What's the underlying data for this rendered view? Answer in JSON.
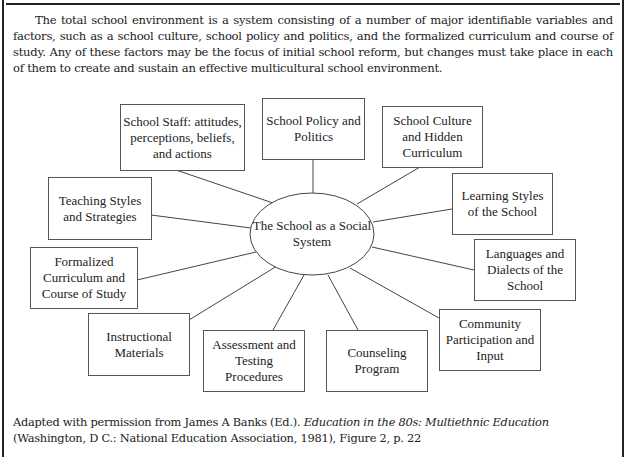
{
  "intro": {
    "text": "The total school environment is a system consisting of a number of major identifiable variables and factors, such as a school culture, school policy and politics, and the formalized curriculum and course of study. Any of these factors may be the focus of initial school reform, but changes must take place in each of them to create and sustain an effective multicultural school environment."
  },
  "diagram": {
    "center": "The School as a Social System",
    "nodes": [
      {
        "id": "school-staff",
        "label": "School Staff: attitudes, perceptions, beliefs, and actions"
      },
      {
        "id": "school-policy",
        "label": "School Policy and Politics"
      },
      {
        "id": "school-culture",
        "label": "School Culture and Hidden Curriculum"
      },
      {
        "id": "teaching-styles",
        "label": "Teaching Styles and Strategies"
      },
      {
        "id": "learning-styles",
        "label": "Learning Styles of the School"
      },
      {
        "id": "formalized-curriculum",
        "label": "Formalized Curriculum and Course of Study"
      },
      {
        "id": "languages",
        "label": "Languages and Dialects of the School"
      },
      {
        "id": "community",
        "label": "Community Participation and Input"
      },
      {
        "id": "instructional-materials",
        "label": "Instructional Materials"
      },
      {
        "id": "assessment",
        "label": "Assessment and Testing Procedures"
      },
      {
        "id": "counseling",
        "label": "Counseling Program"
      }
    ]
  },
  "citation": {
    "prefix": "Adapted with permission from James A Banks (Ed.). ",
    "title": "Education in the 80s: Multiethnic Education",
    "suffix": " (Washington, D C.: National Education Association, 1981), Figure 2, p. 22"
  }
}
